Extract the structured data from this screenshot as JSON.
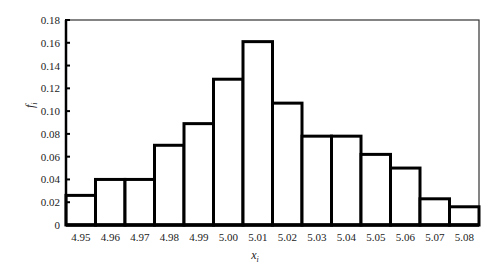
{
  "chart_data": {
    "type": "bar",
    "subtype": "histogram",
    "title": "",
    "xlabel": "x_i",
    "ylabel": "f_i",
    "categories": [
      "4.95",
      "4.96",
      "4.97",
      "4.98",
      "4.99",
      "5.00",
      "5.01",
      "5.02",
      "5.03",
      "5.04",
      "5.05",
      "5.06",
      "5.07",
      "5.08"
    ],
    "values": [
      0.026,
      0.04,
      0.04,
      0.07,
      0.089,
      0.128,
      0.161,
      0.107,
      0.078,
      0.078,
      0.062,
      0.05,
      0.023,
      0.016
    ],
    "ylim": [
      0,
      0.18
    ],
    "yticks": [
      "0",
      "0.02",
      "0.04",
      "0.06",
      "0.08",
      "0.10",
      "0.12",
      "0.14",
      "0.16",
      "0.18"
    ],
    "ytick_values": [
      0,
      0.02,
      0.04,
      0.06,
      0.08,
      0.1,
      0.12,
      0.14,
      0.16,
      0.18
    ],
    "grid": false,
    "legend": null,
    "bar_fill": "#ffffff",
    "bar_stroke": "#000000"
  }
}
